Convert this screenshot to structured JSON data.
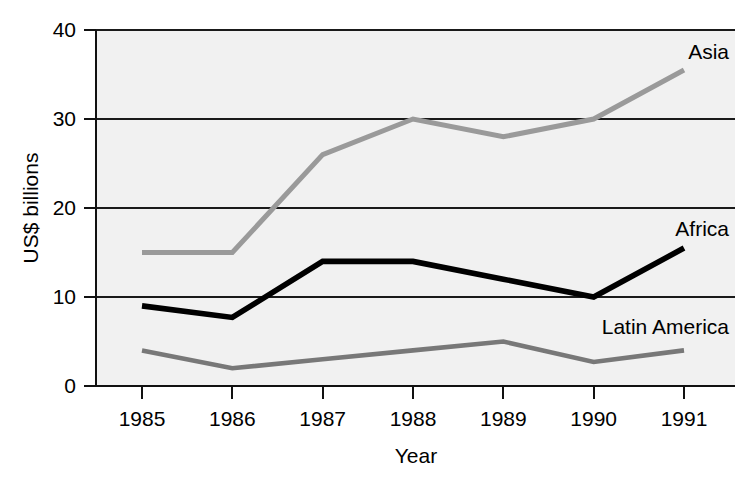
{
  "chart_data": {
    "type": "line",
    "title": "",
    "xlabel": "Year",
    "ylabel": "US$ billions",
    "categories": [
      "1985",
      "1986",
      "1987",
      "1988",
      "1989",
      "1990",
      "1991"
    ],
    "x": [
      1985,
      1986,
      1987,
      1988,
      1989,
      1990,
      1991
    ],
    "xlim": [
      1985,
      1991
    ],
    "ylim": [
      0,
      40
    ],
    "yticks": [
      0,
      10,
      20,
      30,
      40
    ],
    "ytick_labels": [
      "0",
      "10",
      "20",
      "30",
      "40"
    ],
    "xticks": [
      1985,
      1986,
      1987,
      1988,
      1989,
      1990,
      1991
    ],
    "xtick_labels": [
      "1985",
      "1986",
      "1987",
      "1988",
      "1989",
      "1990",
      "1991"
    ],
    "grid": "horizontal",
    "legend_position": "inline-right",
    "plot_background": "#f1f1f1",
    "series": [
      {
        "name": "Asia",
        "color": "#9a9a9a",
        "stroke_width": 5.0,
        "values": [
          15,
          15,
          26,
          30,
          28,
          30,
          35.5
        ],
        "label_value": 37.5
      },
      {
        "name": "Africa",
        "color": "#000000",
        "stroke_width": 5.6,
        "values": [
          9,
          7.7,
          14,
          14,
          12,
          10,
          15.5
        ],
        "label_value": 17.6
      },
      {
        "name": "Latin America",
        "color": "#787878",
        "stroke_width": 4.6,
        "values": [
          4,
          2,
          3,
          4,
          5,
          2.7,
          4
        ],
        "label_value": 6.6
      }
    ]
  },
  "labels": {
    "y_axis_title": "US$ billions",
    "x_axis_title": "Year",
    "series_asia": "Asia",
    "series_africa": "Africa",
    "series_latin_america": "Latin America",
    "ytick_0": "0",
    "ytick_10": "10",
    "ytick_20": "20",
    "ytick_30": "30",
    "ytick_40": "40",
    "xtick_1985": "1985",
    "xtick_1986": "1986",
    "xtick_1987": "1987",
    "xtick_1988": "1988",
    "xtick_1989": "1989",
    "xtick_1990": "1990",
    "xtick_1991": "1991"
  }
}
